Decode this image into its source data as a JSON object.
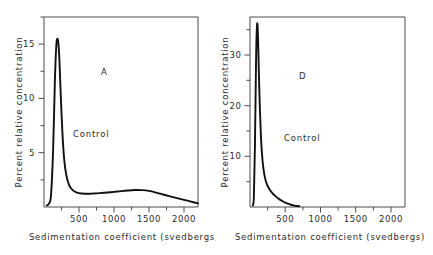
{
  "figure": {
    "background": "#ffffff",
    "line_color": "#111111",
    "axis_color": "#4d4d4d",
    "text_color": "#2b2b2b"
  },
  "chart_data": [
    {
      "type": "line",
      "panel_letter": "A",
      "title": "",
      "xlabel": "Sedimentation coefficient  (svedbergs)",
      "ylabel": "Percent relative concentration",
      "xlim": [
        0,
        2200
      ],
      "ylim": [
        0,
        17.5
      ],
      "xticks": [
        500,
        1000,
        1500,
        2000
      ],
      "xtick_labels": [
        "500",
        "1000",
        "1500",
        "2000"
      ],
      "xticks_minor": [
        250,
        750,
        1250,
        1750
      ],
      "yticks": [
        5,
        10,
        15
      ],
      "ytick_labels": [
        "5",
        "10",
        "15"
      ],
      "yticks_minor": [
        2.5,
        7.5,
        12.5,
        17.5
      ],
      "grid": false,
      "legend": "none",
      "annotations": [
        {
          "text": "A",
          "x": 820,
          "y": 12.2
        },
        {
          "text": "Control",
          "x": 700,
          "y": 6.4
        }
      ],
      "series": [
        {
          "name": "Control",
          "x": [
            40,
            70,
            100,
            130,
            155,
            175,
            190,
            205,
            220,
            240,
            265,
            290,
            320,
            360,
            410,
            470,
            540,
            620,
            700,
            800,
            900,
            1000,
            1100,
            1200,
            1300,
            1400,
            1500,
            1600,
            1700,
            1800,
            1900,
            2000,
            2100,
            2200
          ],
          "y": [
            0.15,
            0.3,
            1.1,
            5.2,
            11.5,
            14.8,
            15.5,
            15.1,
            13.6,
            10.2,
            6.6,
            4.3,
            2.9,
            2.0,
            1.55,
            1.32,
            1.24,
            1.22,
            1.24,
            1.28,
            1.33,
            1.39,
            1.46,
            1.52,
            1.56,
            1.55,
            1.48,
            1.33,
            1.15,
            0.98,
            0.82,
            0.66,
            0.5,
            0.34
          ]
        }
      ]
    },
    {
      "type": "line",
      "panel_letter": "D",
      "title": "",
      "xlabel": "Sedimentation coefficient  (svedbergs)",
      "ylabel": "Percent relative concentration",
      "xlim": [
        0,
        2200
      ],
      "ylim": [
        0,
        37.5
      ],
      "xticks": [
        500,
        1000,
        1500,
        2000
      ],
      "xtick_labels": [
        "500",
        "1000",
        "1500",
        "2000"
      ],
      "xticks_minor": [
        250,
        750,
        1250,
        1750
      ],
      "yticks": [
        10,
        20,
        30
      ],
      "ytick_labels": [
        "10",
        "20",
        "30"
      ],
      "yticks_minor": [
        5,
        15,
        25,
        35
      ],
      "grid": false,
      "legend": "none",
      "annotations": [
        {
          "text": "D",
          "x": 700,
          "y": 25.0
        },
        {
          "text": "Control",
          "x": 620,
          "y": 13.0
        }
      ],
      "series": [
        {
          "name": "Control",
          "x": [
            40,
            55,
            70,
            85,
            95,
            105,
            115,
            125,
            140,
            155,
            170,
            190,
            215,
            245,
            280,
            320,
            365,
            410,
            455,
            500,
            545,
            590,
            630,
            670,
            700
          ],
          "y": [
            0.3,
            2.0,
            12.0,
            28.0,
            34.5,
            36.2,
            33.0,
            27.0,
            19.5,
            14.0,
            10.5,
            7.6,
            5.6,
            4.3,
            3.4,
            2.7,
            2.1,
            1.6,
            1.2,
            0.85,
            0.6,
            0.4,
            0.28,
            0.2,
            0.16
          ]
        }
      ]
    }
  ]
}
